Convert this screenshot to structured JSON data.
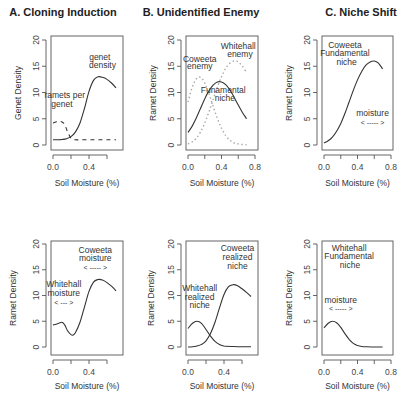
{
  "figure": {
    "columns": [
      {
        "title": "A. Cloning Induction"
      },
      {
        "title": "B. Unidentified Enemy"
      },
      {
        "title": "C. Niche Shift"
      }
    ]
  },
  "chart_data": [
    {
      "id": "A-top",
      "type": "line",
      "title": "A. Cloning Induction",
      "xlabel": "Soil Moisture (%)",
      "ylabel": "Genet Density",
      "xlim": [
        0,
        0.7
      ],
      "ylim": [
        0,
        20
      ],
      "xticks": [
        0,
        0.2,
        0.4,
        0.6
      ],
      "xtick_labels": [
        "0.0",
        "",
        "0.4",
        ""
      ],
      "yticks": [
        0,
        5,
        10,
        15,
        20
      ],
      "ytick_labels": [
        "0",
        "5",
        "10",
        "15",
        "20"
      ],
      "grid": false,
      "series": [
        {
          "name": "genet density",
          "style": "solid",
          "x": [
            0,
            0.05,
            0.1,
            0.15,
            0.2,
            0.25,
            0.3,
            0.35,
            0.4,
            0.45,
            0.5,
            0.55,
            0.6,
            0.65,
            0.7
          ],
          "y": [
            1.0,
            1.0,
            1.05,
            1.2,
            1.6,
            2.5,
            4.2,
            7.0,
            10.2,
            12.3,
            13.0,
            12.9,
            12.5,
            11.8,
            10.9
          ]
        },
        {
          "name": "ramets per genet",
          "style": "dashed",
          "x": [
            0,
            0.03,
            0.06,
            0.1,
            0.13,
            0.16,
            0.2,
            0.25,
            0.3,
            0.4,
            0.5,
            0.6,
            0.7
          ],
          "y": [
            4.2,
            4.4,
            4.5,
            4.4,
            3.9,
            2.6,
            1.3,
            1.0,
            1.0,
            1.0,
            1.0,
            1.0,
            1.0
          ]
        }
      ],
      "annotations": [
        {
          "text": "genet",
          "x": 0.52,
          "y": 16.2
        },
        {
          "text": "density",
          "x": 0.55,
          "y": 14.6
        },
        {
          "text": "ramets per",
          "x": 0.13,
          "y": 9.0
        },
        {
          "text": "genet",
          "x": 0.1,
          "y": 7.3
        }
      ],
      "arrows": []
    },
    {
      "id": "B-top",
      "type": "line",
      "title": "B. Unidentified Enemy",
      "xlabel": "Soil Moisture (%)",
      "ylabel": "Ramet Density",
      "xlim": [
        0,
        0.8
      ],
      "ylim": [
        0,
        20
      ],
      "xticks": [
        0,
        0.2,
        0.4,
        0.6,
        0.8
      ],
      "xtick_labels": [
        "0.0",
        "",
        "0.4",
        "",
        "0.8"
      ],
      "yticks": [
        0,
        5,
        10,
        15,
        20
      ],
      "ytick_labels": [
        "0",
        "5",
        "10",
        "15",
        "20"
      ],
      "grid": false,
      "series": [
        {
          "name": "Funamental niche",
          "style": "solid",
          "x": [
            0,
            0.05,
            0.1,
            0.15,
            0.2,
            0.25,
            0.3,
            0.35,
            0.4,
            0.45,
            0.5,
            0.55,
            0.6,
            0.65,
            0.7
          ],
          "y": [
            2.4,
            3.6,
            5.2,
            7.0,
            8.8,
            10.3,
            11.4,
            12.0,
            12.0,
            11.5,
            10.5,
            9.1,
            7.6,
            6.2,
            5.0
          ]
        },
        {
          "name": "Coweeta enemy",
          "style": "dotted",
          "x": [
            0,
            0.05,
            0.1,
            0.15,
            0.2,
            0.25,
            0.3,
            0.35,
            0.4,
            0.45,
            0.5,
            0.55,
            0.6,
            0.65,
            0.7
          ],
          "y": [
            8.2,
            11.0,
            12.6,
            12.9,
            11.8,
            9.8,
            7.4,
            5.1,
            3.2,
            1.8,
            0.9,
            0.4,
            0.2,
            0.1,
            0.05
          ]
        },
        {
          "name": "Whitehall enemy",
          "style": "dotted",
          "x": [
            0,
            0.05,
            0.1,
            0.15,
            0.2,
            0.25,
            0.3,
            0.35,
            0.4,
            0.45,
            0.5,
            0.55,
            0.6,
            0.65,
            0.7
          ],
          "y": [
            0.2,
            0.6,
            1.3,
            2.5,
            4.2,
            6.3,
            8.6,
            11.0,
            13.0,
            14.6,
            15.6,
            16.0,
            15.8,
            15.0,
            13.8
          ]
        }
      ],
      "annotations": [
        {
          "text": "Whitehall",
          "x": 0.6,
          "y": 18.3
        },
        {
          "text": "enemy",
          "x": 0.62,
          "y": 16.8
        },
        {
          "text": "Coweeta",
          "x": 0.14,
          "y": 15.9
        },
        {
          "text": "enemy",
          "x": 0.14,
          "y": 14.4
        },
        {
          "text": "Funamental",
          "x": 0.42,
          "y": 10.0
        },
        {
          "text": "niche",
          "x": 0.44,
          "y": 8.4
        }
      ],
      "arrows": []
    },
    {
      "id": "C-top",
      "type": "line",
      "title": "C. Niche Shift",
      "xlabel": "Soil Moisture (%)",
      "ylabel": "Ramet Density",
      "xlim": [
        0,
        0.8
      ],
      "ylim": [
        0,
        20
      ],
      "xticks": [
        0,
        0.2,
        0.4,
        0.6,
        0.8
      ],
      "xtick_labels": [
        "0.0",
        "",
        "0.4",
        "",
        "0.8"
      ],
      "yticks": [
        0,
        5,
        10,
        15,
        20
      ],
      "ytick_labels": [
        "0",
        "5",
        "10",
        "15",
        "20"
      ],
      "grid": false,
      "series": [
        {
          "name": "Coweeta Fundamental niche",
          "style": "solid",
          "x": [
            0,
            0.05,
            0.1,
            0.15,
            0.2,
            0.25,
            0.3,
            0.35,
            0.4,
            0.45,
            0.5,
            0.55,
            0.6,
            0.65,
            0.7
          ],
          "y": [
            0.4,
            0.8,
            1.5,
            2.6,
            4.1,
            6.0,
            8.2,
            10.4,
            12.4,
            14.0,
            15.2,
            15.8,
            16.0,
            15.6,
            14.5
          ]
        }
      ],
      "annotations": [
        {
          "text": "Coweeta",
          "x": 0.25,
          "y": 18.5
        },
        {
          "text": "Fundamental",
          "x": 0.25,
          "y": 17.0
        },
        {
          "text": "niche",
          "x": 0.27,
          "y": 15.3
        },
        {
          "text": "moisture",
          "x": 0.58,
          "y": 5.5
        }
      ],
      "arrows": [
        {
          "text": "< ----- >",
          "x": 0.58,
          "y": 3.9
        }
      ]
    },
    {
      "id": "A-bottom",
      "type": "line",
      "title": "",
      "xlabel": "Soil Moisture (%)",
      "ylabel": "Ramet Density",
      "xlim": [
        0,
        0.7
      ],
      "ylim": [
        0,
        20
      ],
      "xticks": [
        0,
        0.2,
        0.4,
        0.6
      ],
      "xtick_labels": [
        "0.0",
        "",
        "0.4",
        ""
      ],
      "yticks": [
        0,
        5,
        10,
        15,
        20
      ],
      "ytick_labels": [
        "0",
        "5",
        "10",
        "15",
        "20"
      ],
      "grid": false,
      "series": [
        {
          "name": "Ramet density",
          "style": "solid",
          "x": [
            0,
            0.05,
            0.1,
            0.13,
            0.16,
            0.2,
            0.22,
            0.25,
            0.3,
            0.35,
            0.4,
            0.45,
            0.5,
            0.55,
            0.6,
            0.65,
            0.7
          ],
          "y": [
            4.3,
            4.5,
            4.8,
            4.3,
            3.2,
            2.4,
            2.3,
            2.8,
            4.8,
            7.8,
            10.8,
            12.6,
            13.1,
            13.0,
            12.5,
            11.8,
            10.9
          ]
        }
      ],
      "annotations": [
        {
          "text": "Coweeta",
          "x": 0.47,
          "y": 18.3
        },
        {
          "text": "moisture",
          "x": 0.47,
          "y": 16.7
        },
        {
          "text": "Whitehall",
          "x": 0.12,
          "y": 11.6
        },
        {
          "text": "moisture",
          "x": 0.12,
          "y": 10.0
        }
      ],
      "arrows": [
        {
          "text": "< ----- >",
          "x": 0.47,
          "y": 15.0
        },
        {
          "text": "< --- >",
          "x": 0.12,
          "y": 8.2
        }
      ]
    },
    {
      "id": "B-bottom",
      "type": "line",
      "title": "",
      "xlabel": "Soil Moisture (%)",
      "ylabel": "Ramet Density",
      "xlim": [
        0,
        0.7
      ],
      "ylim": [
        0,
        20
      ],
      "xticks": [
        0,
        0.2,
        0.4,
        0.6
      ],
      "xtick_labels": [
        "0.0",
        "",
        "0.4",
        ""
      ],
      "yticks": [
        0,
        5,
        10,
        15,
        20
      ],
      "ytick_labels": [
        "0",
        "5",
        "10",
        "15",
        "20"
      ],
      "grid": false,
      "series": [
        {
          "name": "Whitehall realized niche",
          "style": "solid",
          "x": [
            0,
            0.05,
            0.1,
            0.15,
            0.2,
            0.25,
            0.3,
            0.35,
            0.4,
            0.5,
            0.6,
            0.7
          ],
          "y": [
            3.6,
            4.6,
            5.0,
            4.6,
            3.4,
            2.1,
            1.1,
            0.5,
            0.2,
            0.1,
            0.05,
            0.05
          ]
        },
        {
          "name": "Coweeta realized niche",
          "style": "solid",
          "x": [
            0,
            0.05,
            0.1,
            0.15,
            0.2,
            0.25,
            0.3,
            0.35,
            0.4,
            0.45,
            0.5,
            0.55,
            0.6,
            0.65,
            0.7
          ],
          "y": [
            0.0,
            0.05,
            0.2,
            0.5,
            1.2,
            2.6,
            4.8,
            7.6,
            10.2,
            11.7,
            12.1,
            11.9,
            11.3,
            10.6,
            9.8
          ]
        }
      ],
      "annotations": [
        {
          "text": "Coweeta",
          "x": 0.55,
          "y": 18.6
        },
        {
          "text": "realized",
          "x": 0.55,
          "y": 16.9
        },
        {
          "text": "niche",
          "x": 0.55,
          "y": 15.1
        },
        {
          "text": "Whitehall",
          "x": 0.13,
          "y": 10.9
        },
        {
          "text": "realized",
          "x": 0.13,
          "y": 9.2
        },
        {
          "text": "niche",
          "x": 0.13,
          "y": 7.5
        }
      ],
      "arrows": []
    },
    {
      "id": "C-bottom",
      "type": "line",
      "title": "",
      "xlabel": "Soil Moisture (%)",
      "ylabel": "Ramet Density",
      "xlim": [
        0,
        0.8
      ],
      "ylim": [
        0,
        20
      ],
      "xticks": [
        0,
        0.2,
        0.4,
        0.6,
        0.8
      ],
      "xtick_labels": [
        "0.0",
        "",
        "0.4",
        "",
        "0.8"
      ],
      "yticks": [
        0,
        5,
        10,
        15,
        20
      ],
      "ytick_labels": [
        "0",
        "5",
        "10",
        "15",
        "20"
      ],
      "grid": false,
      "series": [
        {
          "name": "Whitehall Fundamental niche",
          "style": "solid",
          "x": [
            0,
            0.05,
            0.1,
            0.15,
            0.2,
            0.25,
            0.3,
            0.35,
            0.4,
            0.45,
            0.5,
            0.6,
            0.7
          ],
          "y": [
            3.7,
            4.6,
            5.0,
            4.7,
            3.8,
            2.6,
            1.5,
            0.7,
            0.3,
            0.1,
            0.05,
            0.0,
            0.0
          ]
        }
      ],
      "annotations": [
        {
          "text": "Whitehall",
          "x": 0.3,
          "y": 18.6
        },
        {
          "text": "Fundamental",
          "x": 0.3,
          "y": 17.0
        },
        {
          "text": "niche",
          "x": 0.31,
          "y": 15.3
        },
        {
          "text": "moisture",
          "x": 0.2,
          "y": 8.6
        }
      ],
      "arrows": [
        {
          "text": "< ----- >",
          "x": 0.2,
          "y": 7.0
        }
      ]
    }
  ],
  "layout_panels": [
    {
      "frame": [
        51,
        36,
        123,
        150
      ],
      "x0px": 53,
      "x1px": 116,
      "x1val": 0.7,
      "y0px": 145,
      "y20px": 40,
      "titleX": 63,
      "titleY": 16,
      "ylabelX": 21,
      "xlabelY": 186
    },
    {
      "frame": [
        186,
        36,
        258,
        150
      ],
      "x0px": 188,
      "x1px": 255,
      "x1val": 0.8,
      "y0px": 145,
      "y20px": 40,
      "titleX": 201,
      "titleY": 16,
      "ylabelX": 156,
      "xlabelY": 186
    },
    {
      "frame": [
        322,
        36,
        393,
        150
      ],
      "x0px": 324,
      "x1px": 391,
      "x1val": 0.8,
      "y0px": 145,
      "y20px": 40,
      "titleX": 361,
      "titleY": 16,
      "ylabelX": 292,
      "xlabelY": 186
    },
    {
      "frame": [
        51,
        241,
        123,
        355
      ],
      "x0px": 53,
      "x1px": 116,
      "x1val": 0.7,
      "y0px": 347,
      "y20px": 244,
      "titleX": 0,
      "titleY": 0,
      "ylabelX": 16,
      "xlabelY": 389
    },
    {
      "frame": [
        186,
        241,
        258,
        355
      ],
      "x0px": 188,
      "x1px": 251,
      "x1val": 0.7,
      "y0px": 347,
      "y20px": 244,
      "titleX": 0,
      "titleY": 0,
      "ylabelX": 154,
      "xlabelY": 389
    },
    {
      "frame": [
        322,
        241,
        393,
        355
      ],
      "x0px": 324,
      "x1px": 391,
      "x1val": 0.8,
      "y0px": 347,
      "y20px": 244,
      "titleX": 0,
      "titleY": 0,
      "ylabelX": 292,
      "xlabelY": 389
    }
  ]
}
